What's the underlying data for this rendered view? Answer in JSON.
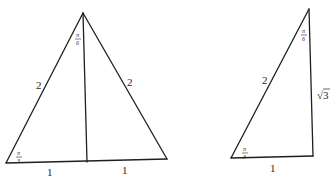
{
  "figure": {
    "left_triangle": {
      "type": "equilateral triangle bisected by altitude",
      "side_labels": {
        "left": "2",
        "right": "2",
        "base_left": "1",
        "base_right": "1"
      },
      "angle_labels": {
        "apex": {
          "num": "π",
          "den": "6"
        },
        "bottom_left": {
          "num": "π",
          "den": "3"
        }
      }
    },
    "right_triangle": {
      "type": "30-60-90 right triangle",
      "side_labels": {
        "hypotenuse": "2",
        "vertical": "√3",
        "base": "1"
      },
      "angle_labels": {
        "apex": {
          "num": "π",
          "den": "6"
        },
        "bottom_left": {
          "num": "π",
          "den": "3"
        }
      }
    }
  }
}
